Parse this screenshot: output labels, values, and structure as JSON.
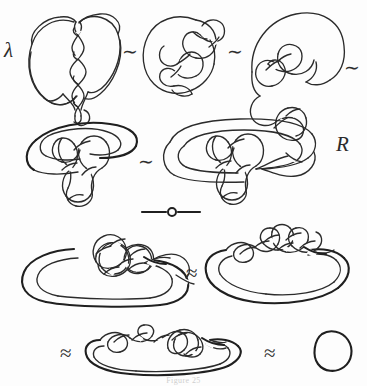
{
  "figure": {
    "kind": "hand-drawn-knot-diagram-sequence",
    "background_color": "#fdfdfd",
    "ink_color": "#2b2b2b",
    "width": 367,
    "height": 386,
    "caption": "Figure 25"
  },
  "labels": {
    "left_margin_glyph": "λ",
    "right_margin_letter": "R"
  },
  "relations": {
    "row1_rel1": "∼",
    "row1_rel2": "∼",
    "row1_rel3": "∼",
    "row2_rel1": "∼",
    "row3_rel1": "≈",
    "row4_rel1": "≈",
    "row4_rel2": "≈"
  },
  "diagrams": [
    {
      "id": "knot-a",
      "name": "heart-loop-with-twisted-braid",
      "row": 1,
      "position": 1
    },
    {
      "id": "knot-b",
      "name": "round-tangle-knot",
      "row": 1,
      "position": 2
    },
    {
      "id": "knot-c",
      "name": "arched-tangle-knot",
      "row": 1,
      "position": 3
    },
    {
      "id": "knot-d",
      "name": "flattened-oval-tangle-knot",
      "row": 2,
      "position": 1
    },
    {
      "id": "knot-e",
      "name": "wide-oval-tangle-knot",
      "row": 2,
      "position": 2
    },
    {
      "id": "knot-f",
      "name": "long-loop-with-central-tangle",
      "row": 3,
      "position": 1
    },
    {
      "id": "knot-g",
      "name": "long-loop-with-spread-tangle",
      "row": 3,
      "position": 2
    },
    {
      "id": "knot-h",
      "name": "flat-loop-with-small-tangle",
      "row": 4,
      "position": 1
    },
    {
      "id": "knot-i",
      "name": "unknot-circle",
      "row": 4,
      "position": 2
    }
  ],
  "ornaments": [
    {
      "id": "section-divider",
      "name": "rule-with-center-ring"
    }
  ]
}
